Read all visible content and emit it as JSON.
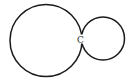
{
  "diagram": {
    "stroke_color": "#1a1a1a",
    "background": "#ffffff",
    "circles": [
      {
        "name": "large-circle",
        "cx": 46,
        "cy": 40.5,
        "r": 36
      },
      {
        "name": "small-circle",
        "cx": 103,
        "cy": 38.5,
        "r": 21.5
      }
    ],
    "points": [
      {
        "label": "C",
        "x": 80,
        "y": 42
      }
    ]
  }
}
